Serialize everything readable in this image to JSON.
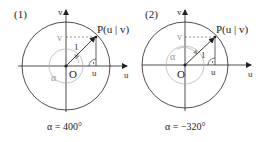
{
  "diagrams": [
    {
      "label": "(1)",
      "point_label": "P(u | v)",
      "origin_label": "O",
      "radius_label": "1",
      "angle_label": "α",
      "u_axis_label": "u",
      "v_axis_label": "v",
      "u_tick_label": "u",
      "v_tick_label": "v",
      "caption": "α = 400°"
    },
    {
      "label": "(2)",
      "point_label": "P(u | v)",
      "origin_label": "O",
      "radius_label": "1",
      "angle_label": "α",
      "u_axis_label": "u",
      "v_axis_label": "v",
      "u_tick_label": "u",
      "v_tick_label": "v",
      "caption": "α = −320°"
    }
  ],
  "colors": {
    "line": "#222222",
    "gray": "#999999"
  }
}
